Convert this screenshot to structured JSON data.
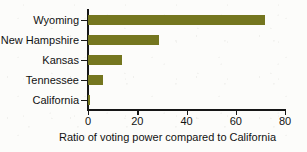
{
  "chart_data": {
    "type": "bar",
    "orientation": "horizontal",
    "title": "",
    "xlabel": "Ratio of voting power compared to California",
    "ylabel": "",
    "categories": [
      "Wyoming",
      "New Hampshire",
      "Kansas",
      "Tennessee",
      "California"
    ],
    "values": [
      72,
      29,
      14,
      6,
      1
    ],
    "xlim": [
      0,
      80
    ],
    "xticks": [
      0,
      20,
      40,
      60,
      80
    ],
    "xtick_labels": [
      "0",
      "20",
      "40",
      "60",
      "80"
    ],
    "grid": false,
    "legend": false,
    "bar_color": "#74761f",
    "axis_color": "#161616",
    "background_color": "#fcfcfa"
  }
}
